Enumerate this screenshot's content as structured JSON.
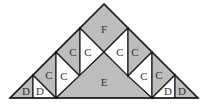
{
  "diagram": {
    "type": "tangram-style triangle dissection",
    "colors": {
      "shaded": "#bdbdbd",
      "white": "#ffffff",
      "stroke": "#1a1a1a",
      "label": "#333333"
    },
    "pieces": [
      {
        "id": "d1",
        "label": "D",
        "fill": "shaded"
      },
      {
        "id": "d2",
        "label": "D",
        "fill": "white"
      },
      {
        "id": "c1",
        "label": "C",
        "fill": "shaded"
      },
      {
        "id": "c2",
        "label": "C",
        "fill": "white"
      },
      {
        "id": "c3",
        "label": "C",
        "fill": "shaded"
      },
      {
        "id": "c4",
        "label": "C",
        "fill": "white"
      },
      {
        "id": "f",
        "label": "F",
        "fill": "shaded"
      },
      {
        "id": "e",
        "label": "E",
        "fill": "shaded"
      },
      {
        "id": "c5",
        "label": "C",
        "fill": "white"
      },
      {
        "id": "c6",
        "label": "C",
        "fill": "shaded"
      },
      {
        "id": "c7",
        "label": "C",
        "fill": "white"
      },
      {
        "id": "c8",
        "label": "C",
        "fill": "shaded"
      },
      {
        "id": "d3",
        "label": "D",
        "fill": "white"
      },
      {
        "id": "d4",
        "label": "D",
        "fill": "shaded"
      }
    ]
  }
}
